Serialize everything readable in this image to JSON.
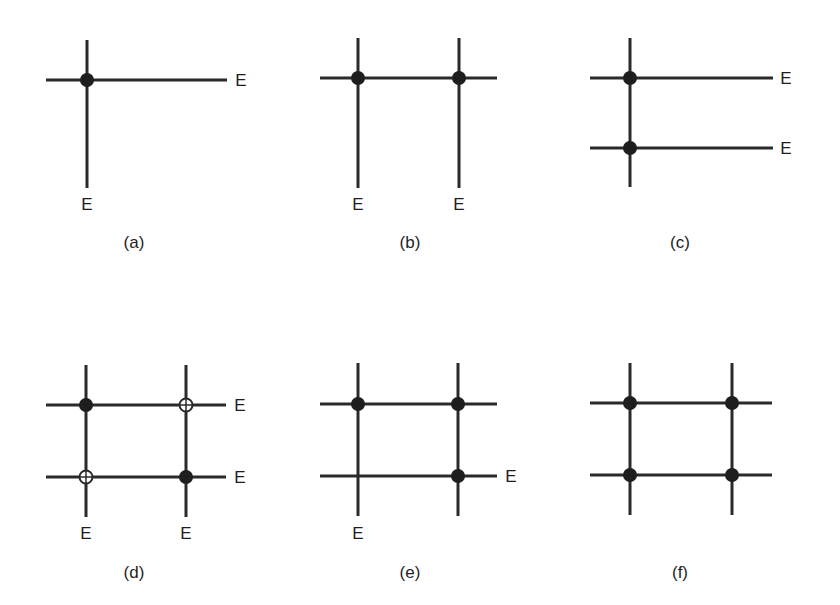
{
  "figure": {
    "panels": [
      {
        "id": "a",
        "caption": "(a)",
        "h_lines": [
          {
            "y": 80,
            "x1": 46,
            "x2": 227
          }
        ],
        "v_lines": [
          {
            "x": 87,
            "y1": 40,
            "y2": 188
          }
        ],
        "nodes": [
          {
            "x": 87,
            "y": 80,
            "type": "filled"
          }
        ],
        "edge_labels": [
          {
            "text": "E",
            "x": 241,
            "y": 86
          },
          {
            "text": "E",
            "x": 87,
            "y": 210
          }
        ],
        "caption_pos": {
          "x": 134,
          "y": 248
        }
      },
      {
        "id": "b",
        "caption": "(b)",
        "h_lines": [
          {
            "y": 78,
            "x1": 320,
            "x2": 497
          }
        ],
        "v_lines": [
          {
            "x": 358,
            "y1": 38,
            "y2": 188
          },
          {
            "x": 459,
            "y1": 38,
            "y2": 188
          }
        ],
        "nodes": [
          {
            "x": 358,
            "y": 78,
            "type": "filled"
          },
          {
            "x": 459,
            "y": 78,
            "type": "filled"
          }
        ],
        "edge_labels": [
          {
            "text": "E",
            "x": 358,
            "y": 210
          },
          {
            "text": "E",
            "x": 459,
            "y": 210
          }
        ],
        "caption_pos": {
          "x": 410,
          "y": 248
        }
      },
      {
        "id": "c",
        "caption": "(c)",
        "h_lines": [
          {
            "y": 78,
            "x1": 590,
            "x2": 773
          },
          {
            "y": 148,
            "x1": 590,
            "x2": 773
          }
        ],
        "v_lines": [
          {
            "x": 630,
            "y1": 38,
            "y2": 187
          }
        ],
        "nodes": [
          {
            "x": 630,
            "y": 78,
            "type": "filled"
          },
          {
            "x": 630,
            "y": 148,
            "type": "filled"
          }
        ],
        "edge_labels": [
          {
            "text": "E",
            "x": 786,
            "y": 84
          },
          {
            "text": "E",
            "x": 786,
            "y": 154
          }
        ],
        "caption_pos": {
          "x": 680,
          "y": 248
        }
      },
      {
        "id": "d",
        "caption": "(d)",
        "h_lines": [
          {
            "y": 405,
            "x1": 46,
            "x2": 226
          },
          {
            "y": 477,
            "x1": 46,
            "x2": 226
          }
        ],
        "v_lines": [
          {
            "x": 86,
            "y1": 365,
            "y2": 517
          },
          {
            "x": 186,
            "y1": 365,
            "y2": 517
          }
        ],
        "nodes": [
          {
            "x": 86,
            "y": 405,
            "type": "filled"
          },
          {
            "x": 186,
            "y": 405,
            "type": "open"
          },
          {
            "x": 86,
            "y": 477,
            "type": "open"
          },
          {
            "x": 186,
            "y": 477,
            "type": "filled"
          }
        ],
        "edge_labels": [
          {
            "text": "E",
            "x": 240,
            "y": 411
          },
          {
            "text": "E",
            "x": 240,
            "y": 483
          },
          {
            "text": "E",
            "x": 86,
            "y": 539
          },
          {
            "text": "E",
            "x": 186,
            "y": 539
          }
        ],
        "caption_pos": {
          "x": 134,
          "y": 578
        }
      },
      {
        "id": "e",
        "caption": "(e)",
        "h_lines": [
          {
            "y": 404,
            "x1": 320,
            "x2": 497
          },
          {
            "y": 476,
            "x1": 320,
            "x2": 497
          }
        ],
        "v_lines": [
          {
            "x": 358,
            "y1": 363,
            "y2": 516
          },
          {
            "x": 458,
            "y1": 363,
            "y2": 516
          }
        ],
        "nodes": [
          {
            "x": 358,
            "y": 404,
            "type": "filled"
          },
          {
            "x": 458,
            "y": 404,
            "type": "filled"
          },
          {
            "x": 458,
            "y": 476,
            "type": "filled"
          }
        ],
        "edge_labels": [
          {
            "text": "E",
            "x": 511,
            "y": 482
          },
          {
            "text": "E",
            "x": 358,
            "y": 539
          }
        ],
        "caption_pos": {
          "x": 410,
          "y": 578
        }
      },
      {
        "id": "f",
        "caption": "(f)",
        "h_lines": [
          {
            "y": 403,
            "x1": 590,
            "x2": 772
          },
          {
            "y": 475,
            "x1": 590,
            "x2": 772
          }
        ],
        "v_lines": [
          {
            "x": 630,
            "y1": 363,
            "y2": 515
          },
          {
            "x": 732,
            "y1": 363,
            "y2": 515
          }
        ],
        "nodes": [
          {
            "x": 630,
            "y": 403,
            "type": "filled"
          },
          {
            "x": 732,
            "y": 403,
            "type": "filled"
          },
          {
            "x": 630,
            "y": 475,
            "type": "filled"
          },
          {
            "x": 732,
            "y": 475,
            "type": "filled"
          }
        ],
        "edge_labels": [],
        "caption_pos": {
          "x": 680,
          "y": 578
        }
      }
    ]
  }
}
